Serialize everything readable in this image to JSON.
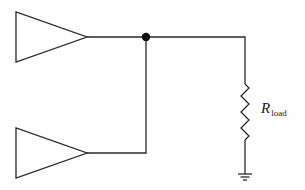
{
  "diagram": {
    "type": "circuit-schematic",
    "components": [
      {
        "id": "buffer-top",
        "kind": "amplifier-triangle"
      },
      {
        "id": "buffer-bottom",
        "kind": "amplifier-triangle"
      },
      {
        "id": "junction",
        "kind": "node-dot"
      },
      {
        "id": "load-resistor",
        "kind": "resistor"
      },
      {
        "id": "ground",
        "kind": "ground"
      }
    ],
    "labels": {
      "resistor_main": "R",
      "resistor_sub": "load"
    },
    "colors": {
      "line": "#2a2a2a",
      "background": "#ffffff"
    }
  }
}
